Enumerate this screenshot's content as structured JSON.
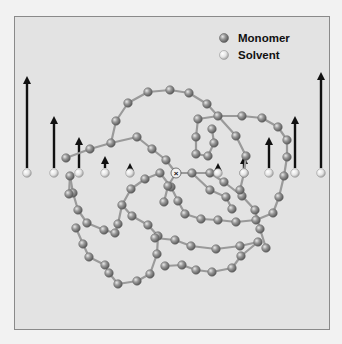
{
  "figure": {
    "background": "#e3e3e3",
    "border_color": "#8a8a8a",
    "legend": {
      "items": [
        {
          "label": "Monomer",
          "x": 224,
          "y": 38,
          "color": "#8e8e8e"
        },
        {
          "label": "Solvent",
          "x": 224,
          "y": 55,
          "color": "#e6e6e6"
        }
      ]
    },
    "center_marker": {
      "symbol": "×",
      "x": 176,
      "y": 173
    },
    "solvent_row_y": 173,
    "solvent_flow": [
      {
        "x": 27,
        "arrow_top": 76
      },
      {
        "x": 54,
        "arrow_top": 116
      },
      {
        "x": 79,
        "arrow_top": 137
      },
      {
        "x": 105,
        "arrow_top": 156
      },
      {
        "x": 130,
        "arrow_top": 163
      },
      {
        "x": 218,
        "arrow_top": 163
      },
      {
        "x": 244,
        "arrow_top": 156
      },
      {
        "x": 269,
        "arrow_top": 137
      },
      {
        "x": 295,
        "arrow_top": 116
      },
      {
        "x": 321,
        "arrow_top": 72
      }
    ],
    "chains": [
      [
        [
          66,
          158
        ],
        [
          90,
          149
        ],
        [
          111,
          143
        ],
        [
          137,
          137
        ],
        [
          152,
          149
        ],
        [
          166,
          160
        ],
        [
          176,
          173
        ],
        [
          192,
          173
        ],
        [
          210,
          173
        ],
        [
          224,
          182
        ],
        [
          242,
          196
        ],
        [
          255,
          210
        ],
        [
          260,
          229
        ],
        [
          266,
          248
        ]
      ],
      [
        [
          111,
          143
        ],
        [
          116,
          121
        ],
        [
          128,
          103
        ],
        [
          148,
          92
        ],
        [
          170,
          90
        ],
        [
          189,
          93
        ],
        [
          207,
          104
        ],
        [
          218,
          116
        ],
        [
          242,
          116
        ],
        [
          262,
          118
        ],
        [
          278,
          127
        ],
        [
          287,
          140
        ],
        [
          287,
          157
        ],
        [
          284,
          176
        ]
      ],
      [
        [
          284,
          176
        ],
        [
          279,
          197
        ],
        [
          273,
          213
        ],
        [
          256,
          220
        ],
        [
          236,
          222
        ],
        [
          218,
          220
        ],
        [
          201,
          219
        ],
        [
          185,
          214
        ],
        [
          178,
          201
        ],
        [
          171,
          187
        ],
        [
          160,
          173
        ]
      ],
      [
        [
          160,
          173
        ],
        [
          145,
          179
        ],
        [
          131,
          189
        ],
        [
          122,
          205
        ],
        [
          118,
          224
        ],
        [
          115,
          233
        ],
        [
          104,
          230
        ],
        [
          87,
          223
        ],
        [
          78,
          210
        ],
        [
          73,
          193
        ],
        [
          70,
          176
        ]
      ],
      [
        [
          70,
          176
        ],
        [
          69,
          194
        ]
      ],
      [
        [
          122,
          205
        ],
        [
          132,
          216
        ],
        [
          148,
          225
        ],
        [
          158,
          236
        ],
        [
          157,
          254
        ],
        [
          150,
          274
        ],
        [
          137,
          281
        ],
        [
          118,
          284
        ],
        [
          109,
          273
        ],
        [
          105,
          265
        ]
      ],
      [
        [
          105,
          265
        ],
        [
          89,
          257
        ],
        [
          83,
          244
        ],
        [
          76,
          228
        ]
      ],
      [
        [
          218,
          116
        ],
        [
          198,
          119
        ],
        [
          196,
          137
        ],
        [
          196,
          154
        ],
        [
          208,
          156
        ],
        [
          214,
          143
        ],
        [
          212,
          129
        ]
      ],
      [
        [
          218,
          116
        ],
        [
          236,
          136
        ],
        [
          246,
          156
        ],
        [
          244,
          173
        ],
        [
          240,
          190
        ]
      ],
      [
        [
          155,
          238
        ],
        [
          175,
          240
        ],
        [
          191,
          246
        ],
        [
          216,
          249
        ],
        [
          240,
          246
        ],
        [
          258,
          242
        ]
      ],
      [
        [
          176,
          173
        ],
        [
          168,
          186
        ],
        [
          164,
          202
        ]
      ],
      [
        [
          192,
          173
        ],
        [
          210,
          190
        ],
        [
          226,
          197
        ],
        [
          232,
          209
        ]
      ],
      [
        [
          258,
          242
        ],
        [
          241,
          256
        ],
        [
          232,
          268
        ],
        [
          212,
          272
        ],
        [
          196,
          270
        ],
        [
          182,
          265
        ],
        [
          165,
          266
        ]
      ]
    ]
  }
}
